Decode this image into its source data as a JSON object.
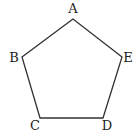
{
  "diagram": {
    "shape": "pentagon",
    "stroke_color": "#333333",
    "vertices": [
      {
        "label": "A",
        "x": 73,
        "y": 19,
        "lx": 73,
        "ly": 13
      },
      {
        "label": "B",
        "x": 22,
        "y": 57,
        "lx": 14,
        "ly": 62
      },
      {
        "label": "C",
        "x": 40,
        "y": 118,
        "lx": 35,
        "ly": 130
      },
      {
        "label": "D",
        "x": 103,
        "y": 118,
        "lx": 107,
        "ly": 130
      },
      {
        "label": "E",
        "x": 122,
        "y": 57,
        "lx": 128,
        "ly": 62
      }
    ]
  }
}
